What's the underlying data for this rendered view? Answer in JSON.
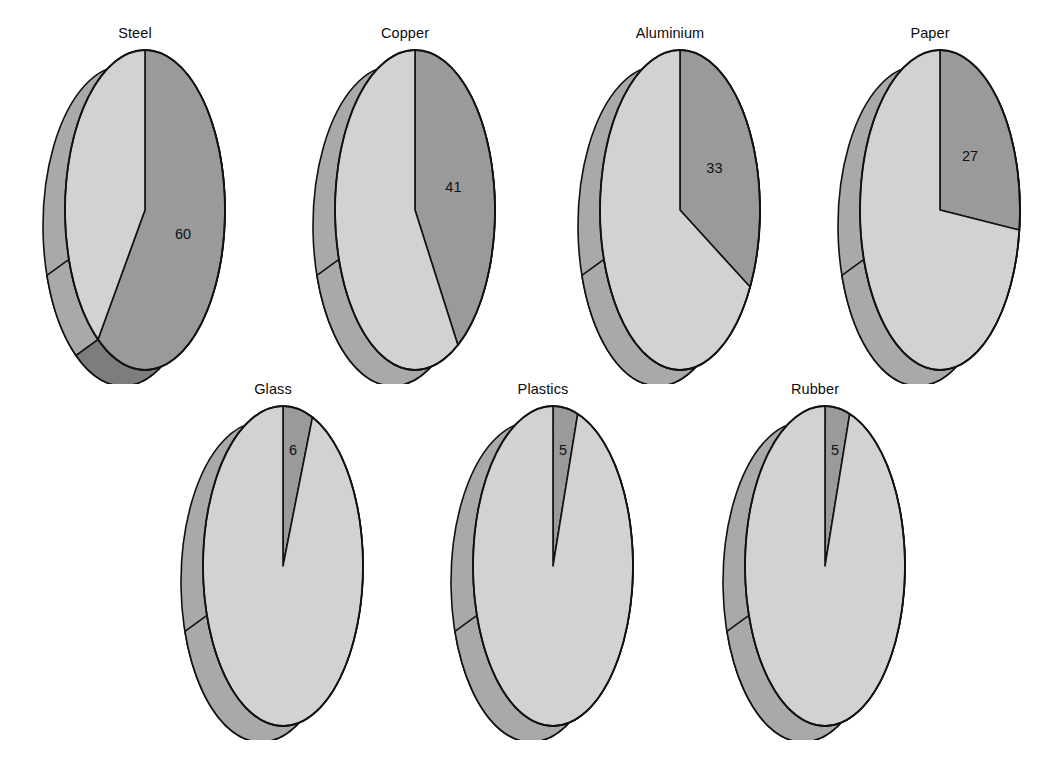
{
  "figure": {
    "background": "#ffffff",
    "units": "percent",
    "colors": {
      "highlight_face": "#9a9a9a",
      "remainder_face": "#d2d2d2",
      "highlight_wall": "#7d7d7d",
      "remainder_wall": "#a9a9a9",
      "outline": "#111111",
      "label": "#0d0d0d"
    }
  },
  "chart_data": {
    "type": "pie",
    "title": "",
    "subtitle": "",
    "xlabel": "",
    "ylabel": "",
    "legend": [],
    "annotations": [],
    "grid": false,
    "value_unit": "%",
    "charts": [
      {
        "id": "steel",
        "title": "Steel",
        "value_label": "60",
        "value": 60,
        "remainder": 40,
        "slices": [
          {
            "name": "highlighted",
            "value": 60,
            "label": "60",
            "color": "#9a9a9a"
          },
          {
            "name": "remainder",
            "value": 40,
            "label": "",
            "color": "#d2d2d2"
          }
        ],
        "row": 1,
        "col": 1
      },
      {
        "id": "copper",
        "title": "Copper",
        "value_label": "41",
        "value": 41,
        "remainder": 59,
        "slices": [
          {
            "name": "highlighted",
            "value": 41,
            "label": "41",
            "color": "#9a9a9a"
          },
          {
            "name": "remainder",
            "value": 59,
            "label": "",
            "color": "#d2d2d2"
          }
        ],
        "row": 1,
        "col": 2
      },
      {
        "id": "aluminium",
        "title": "Aluminium",
        "value_label": "33",
        "value": 33,
        "remainder": 67,
        "slices": [
          {
            "name": "highlighted",
            "value": 33,
            "label": "33",
            "color": "#9a9a9a"
          },
          {
            "name": "remainder",
            "value": 67,
            "label": "",
            "color": "#d2d2d2"
          }
        ],
        "row": 1,
        "col": 3
      },
      {
        "id": "paper",
        "title": "Paper",
        "value_label": "27",
        "value": 27,
        "remainder": 73,
        "slices": [
          {
            "name": "highlighted",
            "value": 27,
            "label": "27",
            "color": "#9a9a9a"
          },
          {
            "name": "remainder",
            "value": 73,
            "label": "",
            "color": "#d2d2d2"
          }
        ],
        "row": 1,
        "col": 4
      },
      {
        "id": "glass",
        "title": "Glass",
        "value_label": "6",
        "value": 6,
        "remainder": 94,
        "slices": [
          {
            "name": "highlighted",
            "value": 6,
            "label": "6",
            "color": "#9a9a9a"
          },
          {
            "name": "remainder",
            "value": 94,
            "label": "",
            "color": "#d2d2d2"
          }
        ],
        "row": 2,
        "col": 1
      },
      {
        "id": "plastics",
        "title": "Plastics",
        "value_label": "5",
        "value": 5,
        "remainder": 95,
        "slices": [
          {
            "name": "highlighted",
            "value": 5,
            "label": "5",
            "color": "#9a9a9a"
          },
          {
            "name": "remainder",
            "value": 95,
            "label": "",
            "color": "#d2d2d2"
          }
        ],
        "row": 2,
        "col": 2
      },
      {
        "id": "rubber",
        "title": "Rubber",
        "value_label": "5",
        "value": 5,
        "remainder": 95,
        "slices": [
          {
            "name": "highlighted",
            "value": 5,
            "label": "5",
            "color": "#9a9a9a"
          },
          {
            "name": "remainder",
            "value": 95,
            "label": "",
            "color": "#d2d2d2"
          }
        ],
        "row": 2,
        "col": 3
      }
    ]
  },
  "layout": {
    "cell_width": 230,
    "cell_height": 360,
    "row1_top": 24,
    "row2_top": 380,
    "row1_lefts": [
      20,
      290,
      555,
      815
    ],
    "row2_lefts": [
      158,
      428,
      700
    ]
  }
}
